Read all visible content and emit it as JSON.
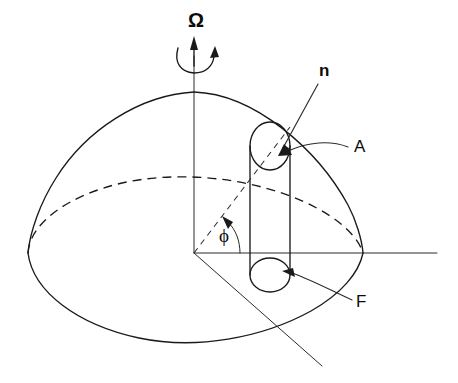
{
  "figure": {
    "domain": "diagram",
    "background_color": "#ffffff",
    "line_color": "#1a1a1a",
    "width": 458,
    "height": 383
  },
  "labels": {
    "rotation_axis": {
      "text": "Ω",
      "name": "omega-label",
      "x": 188,
      "y": 10,
      "description": "angular velocity of rotation, placed above the vertical spin axis"
    },
    "normal_vector": {
      "text": "n",
      "name": "n-label",
      "x": 319,
      "y": 66,
      "description": "unit normal vector label with straight leader arrow to cylinder top cap"
    },
    "area": {
      "text": "A",
      "name": "A-label",
      "x": 352,
      "y": 138,
      "description": "cross-sectional area label with curved leader arrow to top cap"
    },
    "flux": {
      "text": "F",
      "name": "F-label",
      "x": 355,
      "y": 295,
      "description": "flux label with curved leader arrow to bottom cap"
    },
    "azimuth_angle": {
      "text": "ϕ",
      "name": "phi-label",
      "x": 219,
      "y": 226,
      "description": "azimuthal angle phi between the horizontal axis and the dashed radial line"
    }
  },
  "geometry": {
    "origin": {
      "x": 194,
      "y": 253
    },
    "axes": {
      "vertical_axis": {
        "x": 194,
        "y_top": 56,
        "y_bottom": 253,
        "name": "vertical-spin-axis"
      },
      "horizontal_axis": {
        "y": 253,
        "x_left": 194,
        "x_right": 437,
        "name": "horizontal-axis"
      },
      "depth_axis": {
        "x1": 194,
        "y1": 253,
        "x2": 322,
        "y2": 366,
        "name": "depth-axis"
      }
    },
    "body_outline": {
      "apex": {
        "x": 194,
        "y": 92
      },
      "left_edge": {
        "x": 28,
        "y": 253
      },
      "right_edge": {
        "x": 363,
        "y": 253
      },
      "bottom": {
        "x": 194,
        "y": 343
      },
      "name": "teardrop-body-outline"
    },
    "equator": {
      "center_y": 253,
      "semi_major": 167,
      "semi_minor": 72,
      "back_half_dashed": true,
      "name": "equator-ellipse"
    },
    "cylinder": {
      "left_x": 250,
      "right_x": 290,
      "top_center_y": 146,
      "bottom_center_y": 275,
      "cap_semi_minor": 17,
      "name": "flux-tube-cylinder"
    },
    "radial_dashed_line": {
      "x1": 194,
      "y1": 253,
      "x2": 288,
      "y2": 128,
      "name": "radial-dashed-line"
    },
    "phi_arc": {
      "radius": 46,
      "start_deg": 0,
      "end_deg": 53,
      "name": "phi-angle-arc"
    }
  }
}
